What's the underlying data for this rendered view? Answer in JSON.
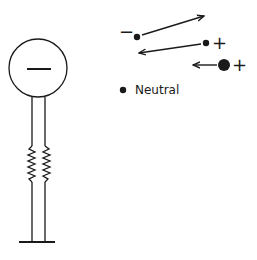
{
  "diagram": {
    "electroscope": {
      "ball_charge_symbol": "−"
    },
    "particles": [
      {
        "charge_label": "−",
        "motion": "moving right-upward"
      },
      {
        "charge_label": "+",
        "motion": "moving left"
      },
      {
        "charge_label": "+",
        "motion": "moving left (large)"
      }
    ],
    "neutral_label": "Neutral"
  }
}
